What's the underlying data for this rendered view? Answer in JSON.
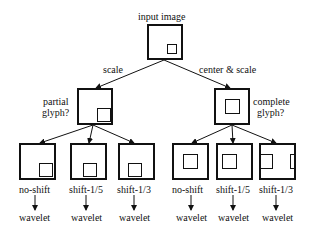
{
  "root": {
    "label": "input image"
  },
  "edges": {
    "left": "scale",
    "right": "center & scale"
  },
  "branches": [
    {
      "label_line1": "partial",
      "label_line2": "glyph?",
      "children": [
        {
          "label": "no-shift",
          "output": "wavelet"
        },
        {
          "label": "shift-1/5",
          "output": "wavelet"
        },
        {
          "label": "shift-1/3",
          "output": "wavelet"
        }
      ]
    },
    {
      "label_line1": "complete",
      "label_line2": "glyph?",
      "children": [
        {
          "label": "no-shift",
          "output": "wavelet"
        },
        {
          "label": "shift-1/5",
          "output": "wavelet"
        },
        {
          "label": "shift-1/3",
          "output": "wavelet"
        }
      ]
    }
  ]
}
